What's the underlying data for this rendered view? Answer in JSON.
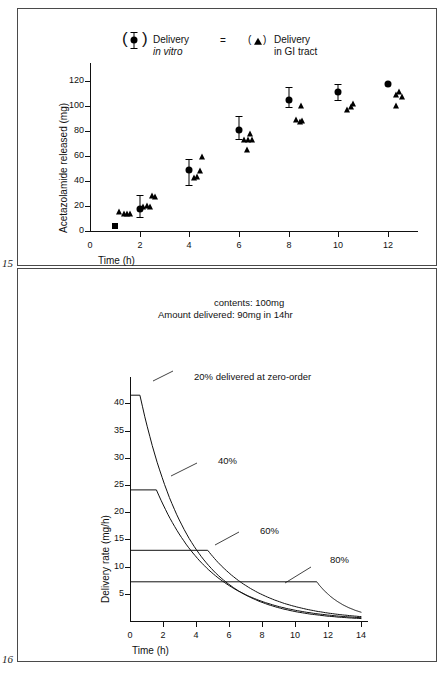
{
  "page_numbers": {
    "top": "15",
    "bottom": "16"
  },
  "figure1": {
    "name": "acetazolamide-release-scatter",
    "legend": [
      {
        "marker": "filled-circle-in-parens",
        "line1": "Delivery",
        "line2": "in vitro",
        "line2_italic": true
      },
      {
        "marker": "filled-triangle-in-parens",
        "line1": "Delivery",
        "line2": "in GI tract",
        "line2_italic": false
      }
    ],
    "legend_separator": "=",
    "chart_data": {
      "type": "scatter",
      "title": "",
      "xlabel": "Time (h)",
      "ylabel": "Acetazolamide released (mg)",
      "xlim": [
        0,
        13.2
      ],
      "ylim": [
        0,
        128
      ],
      "xticks": [
        0,
        2,
        4,
        6,
        8,
        10,
        12
      ],
      "yticks": [
        0,
        20,
        40,
        60,
        80,
        100,
        120
      ],
      "grid": false,
      "legend_position": "top-center",
      "series": [
        {
          "name": "Delivery in vitro",
          "marker": "circle",
          "points": [
            {
              "x": 2.0,
              "y": 18,
              "err_low": 7,
              "err_high": 11
            },
            {
              "x": 4.0,
              "y": 48.5,
              "err_low": 12,
              "err_high": 9
            },
            {
              "x": 6.0,
              "y": 81,
              "err_low": 7,
              "err_high": 11
            },
            {
              "x": 8.0,
              "y": 105,
              "err_low": 6,
              "err_high": 10
            },
            {
              "x": 10.0,
              "y": 111,
              "err_low": 6,
              "err_high": 7
            },
            {
              "x": 12.0,
              "y": 118,
              "err_low": 0,
              "err_high": 0
            }
          ]
        },
        {
          "name": "Delivery in vitro (t=1 square)",
          "marker": "square",
          "points": [
            {
              "x": 1.0,
              "y": 4
            }
          ]
        },
        {
          "name": "Delivery in GI tract",
          "marker": "triangle",
          "points": [
            {
              "x": 1.18,
              "y": 15
            },
            {
              "x": 1.35,
              "y": 14
            },
            {
              "x": 1.5,
              "y": 14
            },
            {
              "x": 1.62,
              "y": 13.5
            },
            {
              "x": 2.15,
              "y": 19.5
            },
            {
              "x": 2.3,
              "y": 20
            },
            {
              "x": 2.42,
              "y": 19.5
            },
            {
              "x": 2.5,
              "y": 28
            },
            {
              "x": 2.62,
              "y": 27.5
            },
            {
              "x": 4.18,
              "y": 42.5
            },
            {
              "x": 4.3,
              "y": 43.5
            },
            {
              "x": 4.42,
              "y": 48
            },
            {
              "x": 4.5,
              "y": 59.5
            },
            {
              "x": 6.2,
              "y": 73
            },
            {
              "x": 6.35,
              "y": 72.5
            },
            {
              "x": 6.45,
              "y": 77.5
            },
            {
              "x": 6.5,
              "y": 73
            },
            {
              "x": 6.3,
              "y": 64.5
            },
            {
              "x": 8.3,
              "y": 88.5
            },
            {
              "x": 8.45,
              "y": 87
            },
            {
              "x": 8.55,
              "y": 88
            },
            {
              "x": 8.5,
              "y": 100
            },
            {
              "x": 10.35,
              "y": 97
            },
            {
              "x": 10.5,
              "y": 99
            },
            {
              "x": 10.6,
              "y": 102
            },
            {
              "x": 12.3,
              "y": 109
            },
            {
              "x": 12.45,
              "y": 111
            },
            {
              "x": 12.55,
              "y": 107
            },
            {
              "x": 12.3,
              "y": 100
            }
          ]
        }
      ]
    }
  },
  "figure2": {
    "name": "delivery-rate-curves",
    "annotations": {
      "contents": "contents: 100mg",
      "amount_delivered": "Amount delivered:  90mg in 14hr",
      "curve_20": "20% delivered at zero-order",
      "curve_40": "40%",
      "curve_60": "60%",
      "curve_80": "80%"
    },
    "chart_data": {
      "type": "line",
      "title": "",
      "xlabel": "Time (h)",
      "ylabel": "Delivery rate (mg/h)",
      "xlim": [
        0,
        14.4
      ],
      "ylim": [
        0,
        43
      ],
      "xticks": [
        0,
        2,
        4,
        6,
        8,
        10,
        12,
        14
      ],
      "yticks": [
        5,
        10,
        15,
        20,
        25,
        30,
        35,
        40
      ],
      "grid": false,
      "legend_position": "inline-labels",
      "series": [
        {
          "name": "20% delivered at zero-order",
          "plateau_rate": 41.5,
          "plateau_end_h": 0.6,
          "decay_end_h": 14.0,
          "decay_end_rate": 0.45
        },
        {
          "name": "40%",
          "plateau_rate": 24.1,
          "plateau_end_h": 1.6,
          "decay_end_h": 14.0,
          "decay_end_rate": 0.6
        },
        {
          "name": "60%",
          "plateau_rate": 13.0,
          "plateau_end_h": 4.7,
          "decay_end_h": 14.0,
          "decay_end_rate": 0.8
        },
        {
          "name": "80%",
          "plateau_rate": 7.2,
          "plateau_end_h": 11.3,
          "decay_end_h": 14.0,
          "decay_end_rate": 1.6
        }
      ]
    }
  }
}
